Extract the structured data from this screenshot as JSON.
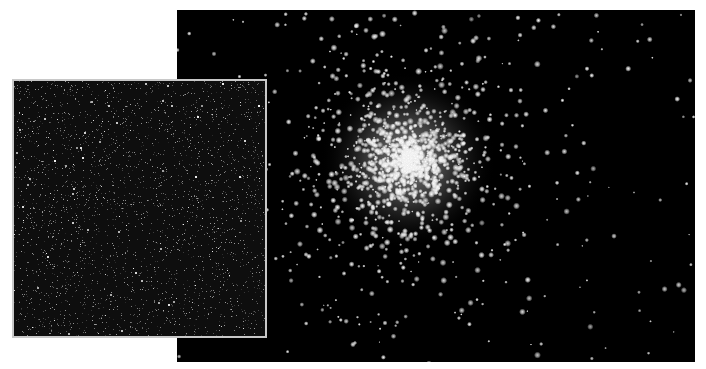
{
  "scene": {
    "description": "Globular star cluster photograph with a grainy dark-field inset",
    "background_color": "#ffffff",
    "main_image": {
      "subject": "globular-star-cluster",
      "background_color": "#000000",
      "cluster_center": [
        231,
        150
      ],
      "core_radius": 55,
      "halo_radius": 190,
      "star_count": 1400,
      "field_star_count": 160,
      "star_color": "#ffffff"
    },
    "inset_image": {
      "subject": "dense-faint-starfield",
      "background_color": "#0e0e0e",
      "border_color": "#c8c8c8",
      "speck_count": 2600
    }
  }
}
